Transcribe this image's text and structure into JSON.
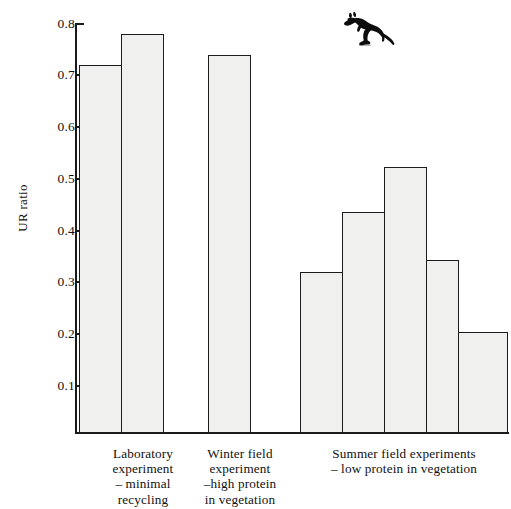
{
  "chart_data": {
    "type": "bar",
    "title": "",
    "xlabel": "",
    "ylabel": "UR ratio",
    "ylim": [
      0.0,
      0.8
    ],
    "ytick_labels": [
      "0.8",
      "0.7",
      "0.6",
      "0.5",
      "0.4",
      "0.3",
      "0.2",
      "0.1"
    ],
    "ytick_values": [
      0.8,
      0.7,
      0.6,
      0.5,
      0.4,
      0.3,
      0.2,
      0.1
    ],
    "grid": false,
    "legend": "none",
    "categories": [
      "Laboratory experiment 1",
      "Laboratory experiment 2",
      "Winter field experiment",
      "Summer field experiment 1",
      "Summer field experiment 2",
      "Summer field experiment 3",
      "Summer field experiment 4",
      "Summer field experiment 5"
    ],
    "values": [
      0.72,
      0.78,
      0.74,
      0.32,
      0.435,
      0.522,
      0.343,
      0.202
    ],
    "groups": [
      {
        "id": "laboratory",
        "bar_indices": [
          0,
          1
        ],
        "caption_lines": [
          "Laboratory",
          "experiment",
          "– minimal",
          "recycling"
        ]
      },
      {
        "id": "winter-field",
        "bar_indices": [
          2
        ],
        "caption_lines": [
          "Winter field",
          "experiment",
          "–high protein",
          "in vegetation"
        ]
      },
      {
        "id": "summer-field",
        "bar_indices": [
          3,
          4,
          5,
          6,
          7
        ],
        "caption_lines": [
          "Summer field experiments",
          "– low protein in vegetation"
        ]
      }
    ]
  },
  "figure": {
    "animal_icon": "wallaby-silhouette-icon",
    "bar_fill_color": "#f0f0ef",
    "bar_border_color": "#1c1c1c",
    "axis_color": "#1a1a1a",
    "background_color": "#ffffff"
  }
}
